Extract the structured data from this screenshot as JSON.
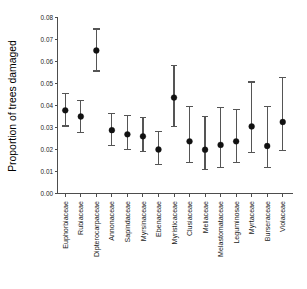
{
  "chart_data": {
    "type": "scatter",
    "title": "",
    "subtitle": "",
    "xlabel": "",
    "ylabel": "Proportion of trees damaged",
    "ylim": [
      0.0,
      0.08
    ],
    "ytick_labels": [
      "0.00",
      "0.01",
      "0.02",
      "0.03",
      "0.04",
      "0.05",
      "0.06",
      "0.07",
      "0.08"
    ],
    "ytick_values": [
      0.0,
      0.01,
      0.02,
      0.03,
      0.04,
      0.05,
      0.06,
      0.07,
      0.08
    ],
    "grid": false,
    "legend": "none",
    "error_bars": "vertical-with-caps",
    "categories": [
      "Euphorbiaceae",
      "Rubiaceae",
      "Dipterocarpaceae",
      "Annonaceae",
      "Sapindaceae",
      "Myrsinaceae",
      "Ebenaceae",
      "Myristicaceae",
      "Clusiaceae",
      "Meliaceae",
      "Melastomataceae",
      "Leguminosae",
      "Myrtaceae",
      "Burseraceae",
      "Violaceae"
    ],
    "values": [
      0.0378,
      0.035,
      0.065,
      0.0288,
      0.0269,
      0.026,
      0.02,
      0.0436,
      0.0237,
      0.0199,
      0.0221,
      0.0237,
      0.0305,
      0.0216,
      0.0325
    ],
    "error_low": [
      0.0307,
      0.0278,
      0.0557,
      0.0218,
      0.0201,
      0.0189,
      0.0132,
      0.0305,
      0.0141,
      0.0108,
      0.0119,
      0.0141,
      0.0187,
      0.0117,
      0.0196
    ],
    "error_high": [
      0.0453,
      0.0422,
      0.0748,
      0.0364,
      0.0353,
      0.0345,
      0.0282,
      0.0581,
      0.0396,
      0.0349,
      0.0391,
      0.0381,
      0.0507,
      0.0396,
      0.0527
    ],
    "marker_color": "#111111",
    "errorbar_color": "#555555",
    "axis_color": "#4d4d4d"
  }
}
